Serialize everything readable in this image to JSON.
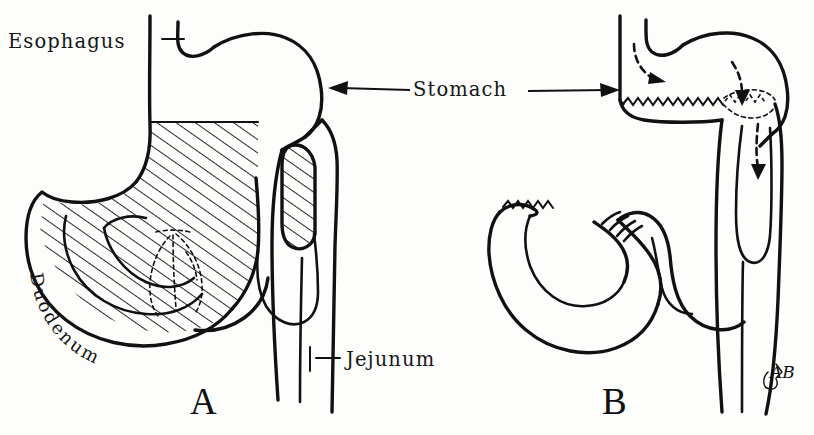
{
  "figure": {
    "background_color": "#fdfdfc",
    "ink_color": "#111111",
    "panels": [
      {
        "id": "A",
        "letter": "A",
        "caption": "Preoperative anatomy with area of resection shown hatched"
      },
      {
        "id": "B",
        "letter": "B",
        "caption": "Postoperative reconstruction with gastric stump, closed duodenal stump and jejunal loop anastomosis"
      }
    ],
    "labels": [
      {
        "name": "esophagus",
        "text": "Esophagus",
        "leader": "tick"
      },
      {
        "name": "stomach",
        "text": "Stomach",
        "leader": "double-arrow"
      },
      {
        "name": "duodenum",
        "text": "Duodenum",
        "leader": "curved-inline"
      },
      {
        "name": "jejunum",
        "text": "Jejunum",
        "leader": "tick"
      }
    ],
    "annotations": {
      "hatching": "resection area",
      "suture_lines": "zigzag stitch marks",
      "flow_arrows": "dashed directional arrows",
      "signature": "AB"
    }
  }
}
